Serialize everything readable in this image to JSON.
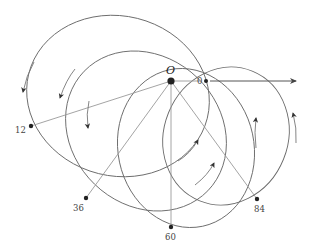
{
  "diagram": {
    "title": "",
    "center": {
      "label": "O",
      "x": 171,
      "y": 81
    },
    "axis": {
      "from": [
        206,
        81
      ],
      "to": [
        298,
        81
      ],
      "start_label": "0"
    },
    "points": [
      {
        "label": "0",
        "x": 206,
        "y": 81
      },
      {
        "label": "12",
        "x": 31,
        "y": 126
      },
      {
        "label": "36",
        "x": 86,
        "y": 198
      },
      {
        "label": "60",
        "x": 171,
        "y": 227
      },
      {
        "label": "84",
        "x": 257,
        "y": 199
      }
    ],
    "orbits": [
      {
        "through": "12",
        "cx": 118,
        "cy": 96,
        "rx": 92,
        "ry": 80,
        "rotate": 14
      },
      {
        "through": "36",
        "cx": 146,
        "cy": 131,
        "rx": 86,
        "ry": 74,
        "rotate": 44
      },
      {
        "through": "60",
        "cx": 186,
        "cy": 148,
        "rx": 80,
        "ry": 68,
        "rotate": 78
      },
      {
        "through": "84",
        "cx": 226,
        "cy": 136,
        "rx": 70,
        "ry": 62,
        "rotate": 112
      }
    ],
    "direction_arrows": [
      "counter-clockwise",
      "counter-clockwise",
      "counter-clockwise",
      "up",
      "up",
      "up-right",
      "up-right"
    ],
    "colors": {
      "line": "#6a6a6a",
      "ray": "#9a9a9a",
      "point": "#222222"
    }
  }
}
